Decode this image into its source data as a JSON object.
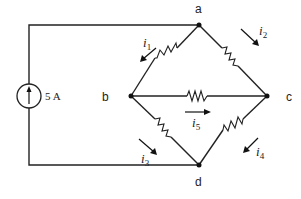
{
  "diagram": {
    "type": "circuit",
    "source": {
      "label": "5 A",
      "kind": "current-source",
      "direction": "up"
    },
    "nodes": [
      {
        "id": "a",
        "label": "a"
      },
      {
        "id": "b",
        "label": "b"
      },
      {
        "id": "c",
        "label": "c"
      },
      {
        "id": "d",
        "label": "d"
      }
    ],
    "branches": [
      {
        "from": "a",
        "to": "b",
        "element": "resistor",
        "current": "i1"
      },
      {
        "from": "a",
        "to": "c",
        "element": "resistor",
        "current": "i2"
      },
      {
        "from": "b",
        "to": "d",
        "element": "resistor",
        "current": "i3"
      },
      {
        "from": "c",
        "to": "d",
        "element": "resistor",
        "current": "i4"
      },
      {
        "from": "b",
        "to": "c",
        "element": "resistor",
        "current": "i5"
      }
    ],
    "currents": {
      "i1": {
        "base": "i",
        "sub": "1"
      },
      "i2": {
        "base": "i",
        "sub": "2"
      },
      "i3": {
        "base": "i",
        "sub": "3"
      },
      "i4": {
        "base": "i",
        "sub": "4"
      },
      "i5": {
        "base": "i",
        "sub": "5"
      }
    },
    "colors": {
      "line": "#222222",
      "background": "#ffffff"
    }
  }
}
